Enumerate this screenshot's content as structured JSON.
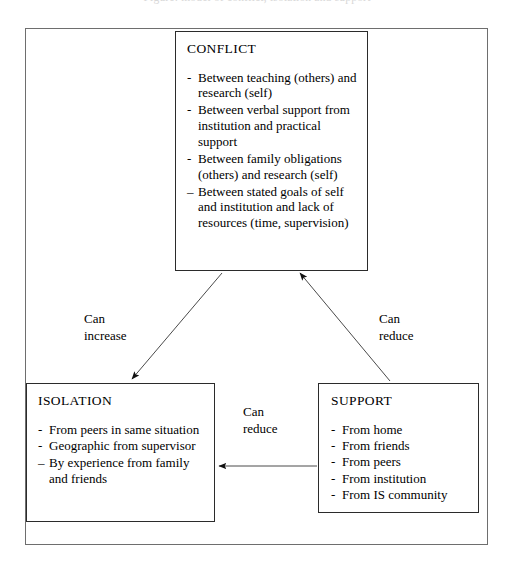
{
  "caption": {
    "clipped_text": "Figure: model of conflict, isolation and support"
  },
  "diagram": {
    "nodes": [
      {
        "id": "conflict",
        "title": "CONFLICT",
        "bullets": [
          {
            "mark": "-",
            "text": "Between teaching (others) and research (self)"
          },
          {
            "mark": "-",
            "text": "Between verbal support from institution and practical support"
          },
          {
            "mark": "-",
            "text": "Between family obligations (others) and research (self)"
          },
          {
            "mark": "–",
            "text": "Between stated goals of self and institution and lack of resources (time, supervision)"
          }
        ]
      },
      {
        "id": "isolation",
        "title": "ISOLATION",
        "bullets": [
          {
            "mark": "-",
            "text": "From peers in same situation"
          },
          {
            "mark": "-",
            "text": "Geographic from supervisor"
          },
          {
            "mark": "–",
            "text": "By experience from family and friends"
          }
        ]
      },
      {
        "id": "support",
        "title": "SUPPORT",
        "bullets": [
          {
            "mark": "-",
            "text": "From home"
          },
          {
            "mark": "-",
            "text": "From friends"
          },
          {
            "mark": "-",
            "text": "From peers"
          },
          {
            "mark": "-",
            "text": "From institution"
          },
          {
            "mark": "-",
            "text": "From IS community"
          }
        ]
      }
    ],
    "edges": [
      {
        "id": "conflict-to-isolation",
        "label": "Can\nincrease",
        "from": "conflict",
        "to": "isolation"
      },
      {
        "id": "support-to-conflict",
        "label": "Can\nreduce",
        "from": "support",
        "to": "conflict"
      },
      {
        "id": "support-to-isolation",
        "label": "Can\nreduce",
        "from": "support",
        "to": "isolation"
      }
    ],
    "colors": {
      "node_border": "#2b2b2b",
      "frame_border": "#6e6e6e",
      "edge_line": "#4a4a4a",
      "text": "#000000",
      "background": "#ffffff"
    }
  }
}
